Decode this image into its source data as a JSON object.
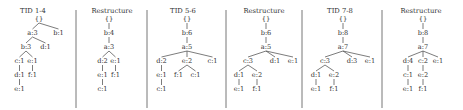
{
  "panels": [
    {
      "title": "TID 1-4",
      "tree": {
        "label": "{}",
        "children": [
          {
            "label": "a:3",
            "children": [
              {
                "label": "b:3",
                "children": [
                  {
                    "label": "c:1",
                    "children": [
                      {
                        "label": "d:1",
                        "children": [
                          {
                            "label": "e:1",
                            "children": []
                          }
                        ]
                      }
                    ]
                  },
                  {
                    "label": "e:1",
                    "children": [
                      {
                        "label": "f:1",
                        "children": []
                      }
                    ]
                  }
                ]
              },
              {
                "label": "d:1",
                "children": []
              }
            ]
          },
          {
            "label": "b:1",
            "children": []
          }
        ]
      }
    },
    {
      "title": "Restructure",
      "tree": {
        "label": "{}",
        "children": [
          {
            "label": "b:4",
            "children": [
              {
                "label": "a:3",
                "children": [
                  {
                    "label": "d:2",
                    "children": [
                      {
                        "label": "e:1",
                        "children": [
                          {
                            "label": "c:1",
                            "children": []
                          }
                        ]
                      }
                    ]
                  },
                  {
                    "label": "e:1",
                    "children": [
                      {
                        "label": "f:1",
                        "children": []
                      }
                    ]
                  }
                ]
              }
            ]
          }
        ]
      }
    },
    {
      "title": "TID 5-6",
      "tree": {
        "label": "{}",
        "children": [
          {
            "label": "b:6",
            "children": [
              {
                "label": "a:5",
                "children": [
                  {
                    "label": "d:2",
                    "children": [
                      {
                        "label": "e:1",
                        "children": [
                          {
                            "label": "c:1",
                            "children": []
                          }
                        ]
                      }
                    ]
                  },
                  {
                    "label": "e:2",
                    "children": [
                      {
                        "label": "f:1",
                        "children": []
                      },
                      {
                        "label": "c:1",
                        "children": []
                      }
                    ]
                  },
                  {
                    "label": "c:1",
                    "children": []
                  }
                ]
              }
            ]
          }
        ]
      }
    },
    {
      "title": "Restructure",
      "tree": {
        "label": "{}",
        "children": [
          {
            "label": "b:6",
            "children": [
              {
                "label": "a:5",
                "children": [
                  {
                    "label": "c:3",
                    "children": [
                      {
                        "label": "d:1",
                        "children": [
                          {
                            "label": "e:1",
                            "children": []
                          }
                        ]
                      },
                      {
                        "label": "e:2",
                        "children": [
                          {
                            "label": "f:1",
                            "children": []
                          }
                        ]
                      }
                    ]
                  },
                  {
                    "label": "d:1",
                    "children": []
                  },
                  {
                    "label": "e:1",
                    "children": []
                  }
                ]
              }
            ]
          }
        ]
      }
    },
    {
      "title": "TID 7-8",
      "tree": {
        "label": "{}",
        "children": [
          {
            "label": "b:8",
            "children": [
              {
                "label": "a:7",
                "children": [
                  {
                    "label": "c:3",
                    "children": [
                      {
                        "label": "d:1",
                        "children": [
                          {
                            "label": "e:1",
                            "children": []
                          }
                        ]
                      },
                      {
                        "label": "e:2",
                        "children": [
                          {
                            "label": "f:1",
                            "children": []
                          }
                        ]
                      }
                    ]
                  },
                  {
                    "label": "d:3",
                    "children": []
                  },
                  {
                    "label": "e:1",
                    "children": []
                  }
                ]
              }
            ]
          }
        ]
      }
    },
    {
      "title": "Restructure",
      "tree": {
        "label": "{}",
        "children": [
          {
            "label": "b:8",
            "children": [
              {
                "label": "a:7",
                "children": [
                  {
                    "label": "d:4",
                    "children": [
                      {
                        "label": "c:1",
                        "children": [
                          {
                            "label": "e:1",
                            "children": []
                          }
                        ]
                      }
                    ]
                  },
                  {
                    "label": "c:2",
                    "children": [
                      {
                        "label": "e:2",
                        "children": [
                          {
                            "label": "f:1",
                            "children": []
                          }
                        ]
                      }
                    ]
                  },
                  {
                    "label": "e:1",
                    "children": []
                  }
                ]
              }
            ]
          }
        ]
      }
    }
  ]
}
